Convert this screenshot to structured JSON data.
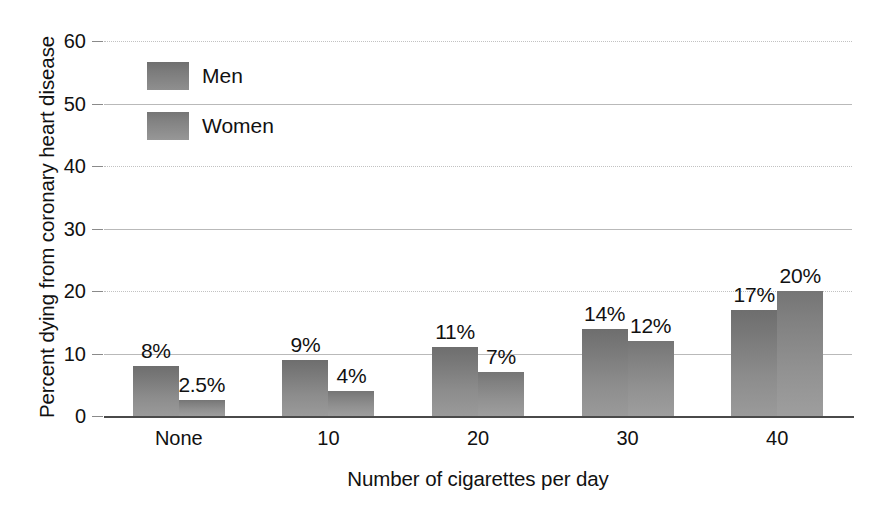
{
  "chart_data": {
    "type": "bar",
    "title": "",
    "xlabel": "Number of cigarettes per day",
    "ylabel": "Percent dying from coronary heart disease",
    "categories": [
      "None",
      "10",
      "20",
      "30",
      "40"
    ],
    "series": [
      {
        "name": "Men",
        "values": [
          8,
          9,
          11,
          14,
          17
        ],
        "labels": [
          "8%",
          "9%",
          "11%",
          "14%",
          "17%"
        ],
        "color": "#7c7c7c"
      },
      {
        "name": "Women",
        "values": [
          2.5,
          4,
          7,
          12,
          20
        ],
        "labels": [
          "2.5%",
          "4%",
          "7%",
          "12%",
          "20%"
        ],
        "color": "#8a8a8a"
      }
    ],
    "ylim": [
      0,
      60
    ],
    "yticks": [
      0,
      10,
      20,
      30,
      40,
      50,
      60
    ],
    "ytick_labels": [
      "0",
      "10",
      "20",
      "30",
      "40",
      "50",
      "60"
    ],
    "grid": true,
    "legend_position": "top-left"
  },
  "legend": {
    "items": [
      {
        "label": "Men"
      },
      {
        "label": "Women"
      }
    ]
  },
  "axes": {
    "y_title": "Percent dying from coronary heart disease",
    "x_title": "Number of cigarettes per day"
  },
  "colors": {
    "bar_men_top": "#6e6e6e",
    "bar_men_bottom": "#9a9a9a",
    "bar_women_top": "#757575",
    "bar_women_bottom": "#9e9e9e",
    "gridline": "#b9b9b9",
    "axis": "#4a4a4a",
    "text": "#111111",
    "background": "#ffffff"
  }
}
